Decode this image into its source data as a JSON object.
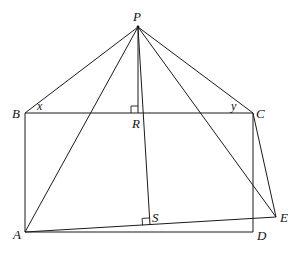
{
  "diagram": {
    "type": "geometry",
    "points": {
      "P": {
        "label": "P",
        "x": 138,
        "y": 27,
        "lx": 133,
        "ly": 21
      },
      "B": {
        "label": "B",
        "x": 25,
        "y": 113,
        "lx": 12,
        "ly": 118
      },
      "C": {
        "label": "C",
        "x": 253,
        "y": 113,
        "lx": 256,
        "ly": 118
      },
      "R": {
        "label": "R",
        "x": 138,
        "y": 113,
        "lx": 132,
        "ly": 128
      },
      "A": {
        "label": "A",
        "x": 25,
        "y": 232,
        "lx": 13,
        "ly": 239
      },
      "D": {
        "label": "D",
        "x": 253,
        "y": 232,
        "lx": 257,
        "ly": 240
      },
      "E": {
        "label": "E",
        "x": 276,
        "y": 217,
        "lx": 280,
        "ly": 222
      },
      "S": {
        "label": "S",
        "x": 150,
        "y": 225,
        "lx": 152,
        "ly": 222
      }
    },
    "angle_labels": {
      "x": {
        "label": "x",
        "lx": 37,
        "ly": 110
      },
      "y": {
        "label": "y",
        "lx": 231,
        "ly": 110
      }
    },
    "segments": [
      [
        "P",
        "B"
      ],
      [
        "P",
        "C"
      ],
      [
        "P",
        "A"
      ],
      [
        "P",
        "E"
      ],
      [
        "P",
        "R"
      ],
      [
        "P",
        "S"
      ],
      [
        "B",
        "C"
      ],
      [
        "B",
        "A"
      ],
      [
        "A",
        "D"
      ],
      [
        "C",
        "D"
      ],
      [
        "C",
        "E"
      ],
      [
        "A",
        "E"
      ]
    ],
    "right_angles": [
      "R",
      "S"
    ]
  }
}
